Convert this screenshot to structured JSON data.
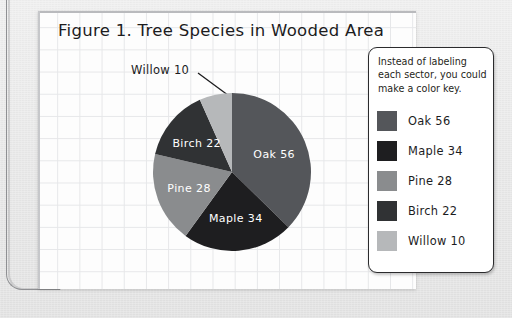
{
  "figure": {
    "title": "Figure 1. Tree Species in Wooded Area"
  },
  "legend": {
    "note": "Instead of labeling each sector, you could make a color key.",
    "items": [
      {
        "label": "Oak 56",
        "color": "#54565a"
      },
      {
        "label": "Maple 34",
        "color": "#1e1e20"
      },
      {
        "label": "Pine 28",
        "color": "#8a8c8e"
      },
      {
        "label": "Birch 22",
        "color": "#303234"
      },
      {
        "label": "Willow 10",
        "color": "#b6b8ba"
      }
    ]
  },
  "callout": {
    "willow_label": "Willow 10"
  },
  "chart_data": {
    "type": "pie",
    "title": "Figure 1. Tree Species in Wooded Area",
    "categories": [
      "Oak",
      "Maple",
      "Pine",
      "Birch",
      "Willow"
    ],
    "values": [
      56,
      34,
      28,
      22,
      10
    ],
    "total": 150,
    "slice_labels": [
      "Oak 56",
      "Maple 34",
      "Pine 28",
      "Birch 22",
      "Willow 10"
    ],
    "colors": [
      "#54565a",
      "#1e1e20",
      "#8a8c8e",
      "#303234",
      "#b6b8ba"
    ],
    "label_placement": [
      "inside",
      "inside",
      "inside",
      "inside",
      "callout"
    ],
    "legend_position": "right",
    "grid": true,
    "start_angle_deg": 0,
    "direction": "clockwise"
  }
}
